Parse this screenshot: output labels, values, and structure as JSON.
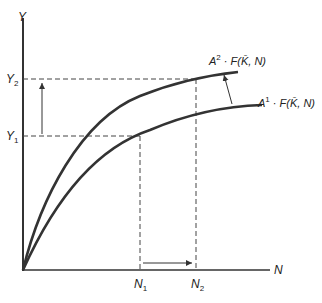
{
  "diagram": {
    "axes": {
      "y_label": "Y",
      "x_label": "N"
    },
    "curves": [
      {
        "name": "upper",
        "label_coef": "A",
        "label_exp": "2",
        "label_rest": " · F(K̄, N)"
      },
      {
        "name": "lower",
        "label_coef": "A",
        "label_exp": "1",
        "label_rest": " · F(K̄, N)"
      }
    ],
    "y_ticks": [
      {
        "base": "Y",
        "sub": "2"
      },
      {
        "base": "Y",
        "sub": "1"
      }
    ],
    "x_ticks": [
      {
        "base": "N",
        "sub": "1"
      },
      {
        "base": "N",
        "sub": "2"
      }
    ],
    "colors": {
      "line": "#333333",
      "dash": "#444444"
    }
  }
}
